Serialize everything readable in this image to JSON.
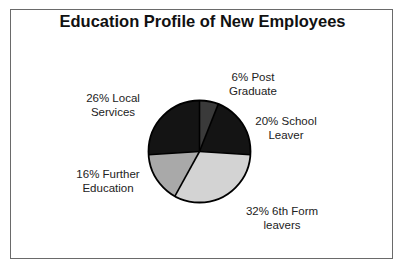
{
  "chart_data": {
    "type": "pie",
    "title": "Education Profile of New Employees",
    "categories": [
      "Post Graduate",
      "School Leaver",
      "6th Form leavers",
      "Further Education",
      "Local Services"
    ],
    "values": [
      6,
      20,
      32,
      16,
      26
    ],
    "unit": "%",
    "colors": [
      "#3a3a3a",
      "#141414",
      "#d3d3d3",
      "#a9a9a9",
      "#141414"
    ],
    "start_angle_deg": 0,
    "direction": "clockwise",
    "labels": [
      {
        "line1": "6% Post",
        "line2": "Graduate"
      },
      {
        "line1": "20% School",
        "line2": "Leaver"
      },
      {
        "line1": "32% 6th Form",
        "line2": "leavers"
      },
      {
        "line1": "16% Further",
        "line2": "Education"
      },
      {
        "line1": "26% Local",
        "line2": "Services"
      }
    ],
    "legend": "none (data labels placed around pie)"
  }
}
